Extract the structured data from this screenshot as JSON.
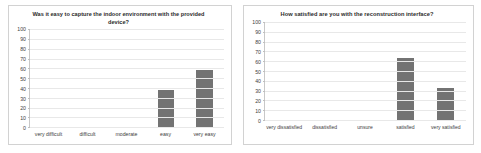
{
  "figure": {
    "background": "#ffffff",
    "panel_border_color": "#d2d2d2",
    "bar_color": "#737373",
    "gridline_color": "#e8e8e8"
  },
  "chart_data": [
    {
      "id": "capture-ease",
      "type": "bar",
      "title": "Was it easy to capture the indoor environment with the provided device?",
      "xlabel": "",
      "ylabel": "",
      "categories": [
        "very difficult",
        "difficult",
        "moderate",
        "easy",
        "very easy"
      ],
      "values": [
        0,
        0,
        0,
        38,
        58
      ],
      "ylim": [
        0,
        100
      ],
      "yticks": [
        100,
        90,
        80,
        70,
        60,
        50,
        40,
        30,
        20,
        10,
        0
      ],
      "grid": true,
      "legend": "none",
      "bar_color": "#737373"
    },
    {
      "id": "interface-satisfaction",
      "type": "bar",
      "title": "How satisfied are you with the reconstruction interface?",
      "xlabel": "",
      "ylabel": "",
      "categories": [
        "very dissatisfied",
        "dissatisfied",
        "unsure",
        "satisfied",
        "very satisfied"
      ],
      "values": [
        0,
        0,
        0,
        63,
        33
      ],
      "ylim": [
        0,
        100
      ],
      "yticks": [
        100,
        90,
        80,
        70,
        60,
        50,
        40,
        30,
        20,
        10,
        0
      ],
      "grid": true,
      "legend": "none",
      "bar_color": "#737373"
    }
  ]
}
